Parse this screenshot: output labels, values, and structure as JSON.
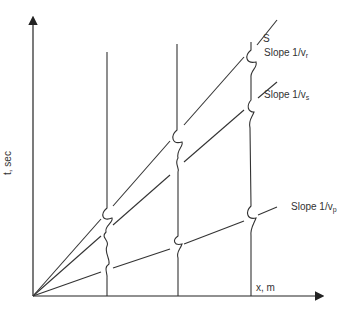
{
  "diagram": {
    "type": "travel-time plot (t vs x)",
    "axes": {
      "y_label": "t, sec",
      "x_label": "x, m"
    },
    "source_label": "S",
    "slopes": [
      {
        "id": "r",
        "label": "Slope 1/v",
        "sub": "r"
      },
      {
        "id": "s",
        "label": "Slope 1/v",
        "sub": "s"
      },
      {
        "id": "p",
        "label": "Slope 1/v",
        "sub": "p"
      }
    ],
    "receivers": 3,
    "colors": {
      "line": "#333333",
      "background": "#ffffff"
    }
  }
}
